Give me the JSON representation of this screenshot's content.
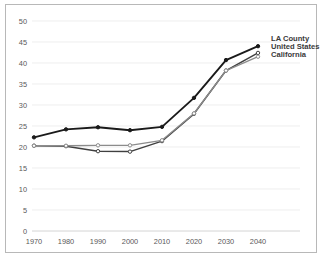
{
  "chart_data": {
    "type": "line",
    "title": "",
    "xlabel": "",
    "ylabel": "",
    "categories": [
      "1970",
      "1980",
      "1990",
      "2000",
      "2010",
      "2020",
      "2030",
      "2040"
    ],
    "x": [
      1970,
      1980,
      1990,
      2000,
      2010,
      2020,
      2030,
      2040
    ],
    "xlim": [
      1970,
      2040
    ],
    "ylim": [
      0,
      50
    ],
    "ytick_labels": [
      "0",
      "5",
      "10",
      "15",
      "20",
      "25",
      "30",
      "35",
      "40",
      "45",
      "50"
    ],
    "ytick_values": [
      0,
      5,
      10,
      15,
      20,
      25,
      30,
      35,
      40,
      45,
      50
    ],
    "xtick_labels": [
      "1970",
      "1980",
      "1990",
      "2000",
      "2010",
      "2020",
      "2030",
      "2040"
    ],
    "grid": true,
    "legend_position": "right-inside-top",
    "series": [
      {
        "name": "LA County",
        "color": "#1a1a1a",
        "values": [
          22.3,
          24.2,
          24.7,
          24.0,
          24.8,
          31.7,
          40.7,
          44.0
        ]
      },
      {
        "name": "United States",
        "color": "#404040",
        "values": [
          20.3,
          20.2,
          19.0,
          18.9,
          21.4,
          27.9,
          38.2,
          42.4
        ]
      },
      {
        "name": "California",
        "color": "#8c8c8c",
        "values": [
          20.3,
          20.3,
          20.4,
          20.4,
          21.6,
          28.0,
          38.2,
          41.5
        ]
      }
    ]
  },
  "legend": {
    "items": [
      {
        "label": "LA County"
      },
      {
        "label": "United States"
      },
      {
        "label": "California"
      }
    ]
  },
  "colors": {
    "frame_border": "#b8b8b8",
    "gridline": "#e6e6e6",
    "tick_text": "#595959",
    "legend_text": "#3a3a3a",
    "background": "#ffffff"
  }
}
